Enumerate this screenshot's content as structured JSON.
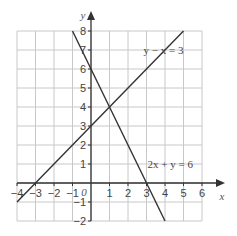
{
  "chart_data": {
    "type": "line",
    "title": "",
    "xlabel": "x",
    "ylabel": "y",
    "origin_label": "0",
    "xlim": [
      -4,
      6
    ],
    "ylim": [
      -2,
      8
    ],
    "grid": true,
    "x_ticks": [
      -4,
      -3,
      -2,
      -1,
      1,
      2,
      3,
      4,
      5,
      6
    ],
    "y_ticks": [
      -2,
      -1,
      1,
      2,
      3,
      4,
      5,
      6,
      7,
      8
    ],
    "series": [
      {
        "name": "y − x = 3",
        "label": "y − x = 3",
        "x": [
          -4,
          5
        ],
        "y": [
          -1,
          8
        ]
      },
      {
        "name": "2x + y = 6",
        "label": "2x + y = 6",
        "x": [
          -1,
          4
        ],
        "y": [
          8,
          -2
        ]
      }
    ],
    "intersection": {
      "x": 1,
      "y": 4
    },
    "colors": {
      "grid": "#c8c8c8",
      "axis": "#333333",
      "line": "#333333"
    }
  }
}
